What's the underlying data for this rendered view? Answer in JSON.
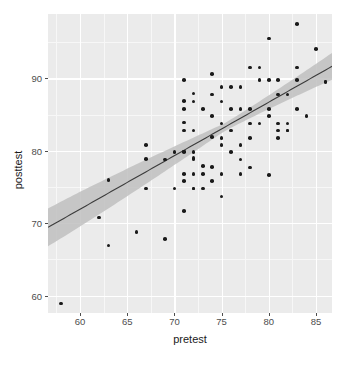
{
  "chart_data": {
    "type": "scatter",
    "title": "",
    "xlabel": "pretest",
    "ylabel": "posttest",
    "xlim": [
      56.6,
      86.7
    ],
    "ylim": [
      57.6,
      98.9
    ],
    "xticks": [
      60,
      65,
      70,
      75,
      80,
      85
    ],
    "yticks": [
      60,
      70,
      80,
      90
    ],
    "xtick_labels": [
      "60",
      "65",
      "70",
      "75",
      "80",
      "85"
    ],
    "ytick_labels": [
      "60",
      "70",
      "80",
      "90"
    ],
    "x_minor_ticks": [
      57.5,
      62.5,
      67.5,
      72.5,
      77.5,
      82.5
    ],
    "y_minor_ticks": [
      65,
      75,
      85,
      95
    ],
    "grid": true,
    "legend": null,
    "panel_background": "#ebebeb",
    "grid_major_color": "#ffffff",
    "grid_minor_color": "#f7f7f7",
    "point_color": "#1a1a1a",
    "line_color": "#3c3c3c",
    "band_color": "#bfbfbf",
    "fit": {
      "kind": "linear-regression-with-confidence-band",
      "slope": 0.739,
      "intercept": 27.6,
      "x_start": 56.6,
      "x_end": 86.7,
      "y_start": 69.4,
      "y_end": 91.7,
      "band_halfwidth_start": 2.6,
      "band_halfwidth_min": 0.55,
      "band_halfwidth_end": 1.85,
      "band_min_at_x": 75.2
    },
    "x": [
      58.0,
      62.0,
      63.0,
      63.0,
      66.0,
      67.0,
      67.0,
      67.0,
      69.0,
      69.0,
      70.0,
      70.0,
      71.0,
      71.0,
      71.0,
      71.0,
      71.0,
      71.0,
      71.0,
      71.0,
      71.0,
      71.0,
      72.0,
      72.0,
      72.0,
      72.0,
      72.0,
      72.0,
      72.0,
      72.0,
      72.0,
      73.0,
      73.0,
      73.0,
      73.0,
      74.0,
      74.0,
      74.0,
      74.0,
      74.0,
      74.0,
      75.0,
      75.0,
      75.0,
      75.0,
      75.0,
      75.0,
      75.0,
      76.0,
      76.0,
      76.0,
      76.0,
      77.0,
      77.0,
      77.0,
      77.0,
      77.0,
      78.0,
      78.0,
      78.0,
      78.0,
      78.0,
      79.0,
      79.0,
      79.0,
      80.0,
      80.0,
      80.0,
      80.0,
      80.0,
      81.0,
      81.0,
      81.0,
      81.0,
      81.0,
      82.0,
      82.0,
      82.0,
      82.0,
      83.0,
      83.0,
      83.0,
      83.0,
      84.0,
      85.0,
      86.0,
      86.0
    ],
    "y": [
      58.9,
      70.8,
      76.0,
      66.9,
      68.8,
      80.8,
      78.9,
      74.8,
      78.8,
      67.8,
      79.8,
      74.8,
      89.8,
      86.9,
      85.8,
      83.9,
      82.8,
      79.9,
      79.8,
      76.8,
      75.8,
      71.7,
      87.9,
      86.8,
      82.8,
      79.8,
      79.0,
      78.8,
      76.8,
      74.8,
      74.8,
      85.8,
      77.9,
      76.8,
      74.8,
      90.6,
      87.8,
      84.8,
      81.9,
      77.8,
      75.8,
      88.8,
      86.8,
      83.8,
      81.8,
      80.8,
      76.8,
      73.7,
      88.8,
      85.8,
      82.8,
      79.8,
      88.8,
      85.8,
      80.8,
      78.8,
      76.8,
      91.5,
      85.8,
      83.8,
      81.8,
      77.7,
      91.5,
      89.8,
      83.8,
      95.5,
      89.8,
      85.8,
      84.8,
      76.7,
      89.8,
      87.8,
      83.8,
      82.8,
      81.8,
      87.8,
      83.8,
      82.8,
      82.8,
      97.5,
      91.5,
      89.8,
      85.8,
      84.8,
      94.1,
      89.6,
      89.5
    ]
  }
}
